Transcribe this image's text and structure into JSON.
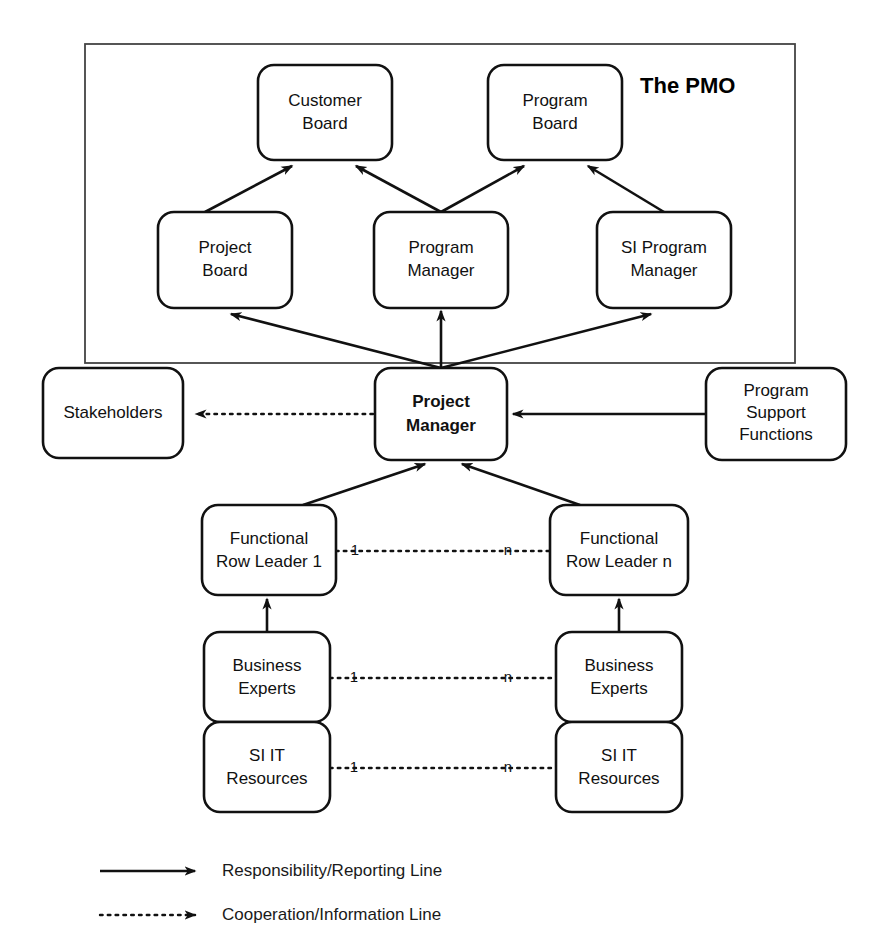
{
  "diagram": {
    "group": {
      "label": "The PMO"
    },
    "nodes": {
      "customer_board": "Customer\nBoard",
      "customer_board_line1": "Customer",
      "customer_board_line2": "Board",
      "program_board_line1": "Program",
      "program_board_line2": "Board",
      "project_board_line1": "Project",
      "project_board_line2": "Board",
      "program_manager_line1": "Program",
      "program_manager_line2": "Manager",
      "si_program_manager_line1": "SI Program",
      "si_program_manager_line2": "Manager",
      "project_manager_line1": "Project",
      "project_manager_line2": "Manager",
      "stakeholders": "Stakeholders",
      "program_support_line1": "Program",
      "program_support_line2": "Support",
      "program_support_line3": "Functions",
      "functional_row_leader_1_line1": "Functional",
      "functional_row_leader_1_line2": "Row Leader 1",
      "functional_row_leader_n_line1": "Functional",
      "functional_row_leader_n_line2": "Row Leader n",
      "business_experts_left_line1": "Business",
      "business_experts_left_line2": "Experts",
      "business_experts_right_line1": "Business",
      "business_experts_right_line2": "Experts",
      "si_it_resources_left_line1": "SI IT",
      "si_it_resources_left_line2": "Resources",
      "si_it_resources_right_line1": "SI IT",
      "si_it_resources_right_line2": "Resources"
    },
    "multiplicity": {
      "row_leader_from": "1",
      "row_leader_to": "n",
      "business_experts_from": "1",
      "business_experts_to": "n",
      "si_it_from": "1",
      "si_it_to": "n"
    },
    "legend": {
      "solid_label": "Responsibility/Reporting Line",
      "dotted_label": "Cooperation/Information Line"
    },
    "colors": {
      "background": "#ffffff",
      "box_stroke": "#111111",
      "box_fill": "#ffffff",
      "frame_stroke": "#444444",
      "text": "#111111"
    }
  }
}
